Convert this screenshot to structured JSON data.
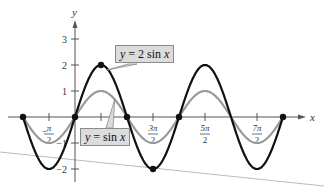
{
  "chart_data": {
    "type": "line",
    "title": "",
    "xlabel": "x",
    "ylabel": "y",
    "xlim": [
      -3.4,
      13.5
    ],
    "ylim": [
      -2.5,
      3.7
    ],
    "grid": false,
    "x_ticks": [
      "-π/2",
      "π/2",
      "3π/2",
      "5π/2",
      "7π/2"
    ],
    "y_ticks": [
      "-2",
      "-1",
      "1",
      "2",
      "3"
    ],
    "series": [
      {
        "name": "y = 2 sin x",
        "expr": "2*sin(x)",
        "domain": [
          -3.14159,
          12.566
        ],
        "color": "#111111",
        "width": 2.2,
        "marked_points": [
          [
            -3.14159,
            0
          ],
          [
            0,
            0
          ],
          [
            1.5708,
            2
          ],
          [
            3.14159,
            0
          ],
          [
            4.7124,
            -2
          ],
          [
            6.2832,
            0
          ],
          [
            12.566,
            0
          ]
        ]
      },
      {
        "name": "y = sin x",
        "expr": "sin(x)",
        "domain": [
          -3.14159,
          12.566
        ],
        "color": "#999999",
        "width": 2.2
      }
    ],
    "annotations": [
      {
        "text": "y = 2 sin x",
        "points_to": [
          1.9,
          1.8
        ]
      },
      {
        "text": "y = sin x",
        "points_to": [
          2.4,
          0.7
        ]
      }
    ]
  },
  "labels": {
    "two_sin": {
      "pre": "y",
      "mid": " = 2 sin ",
      "post": "x"
    },
    "sin": {
      "pre": "y",
      "mid": " = sin ",
      "post": "x"
    },
    "x_axis": "x",
    "y_axis": "y"
  }
}
